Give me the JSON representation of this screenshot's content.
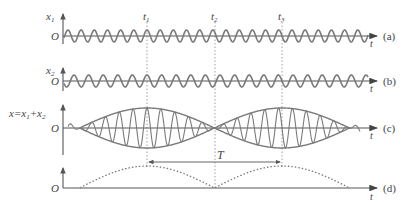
{
  "figure": {
    "colors": {
      "wave": "#7a7a7a",
      "axis": "#555555",
      "text": "#444444",
      "dotted": "#7a7a7a",
      "background": "#ffffff"
    },
    "panels": [
      {
        "id": "a",
        "tag": "(a)",
        "ylabel": "x",
        "ylabel_sub": "1",
        "origin": "O",
        "xlabel": "t"
      },
      {
        "id": "b",
        "tag": "(b)",
        "ylabel": "x",
        "ylabel_sub": "2",
        "origin": "O",
        "xlabel": "t"
      },
      {
        "id": "c",
        "tag": "(c)",
        "ylabel": "x=x",
        "ylabel_sub": "1",
        "ylabel_plus": "+x",
        "ylabel_sub2": "2",
        "origin": "O",
        "xlabel": "t"
      },
      {
        "id": "d",
        "tag": "(d)",
        "origin": "O",
        "xlabel": "t"
      }
    ],
    "time_markers": [
      {
        "label": "t",
        "sub": "1"
      },
      {
        "label": "t",
        "sub": "2"
      },
      {
        "label": "t",
        "sub": "3"
      }
    ],
    "period_label": "T"
  },
  "chart_data": {
    "type": "line",
    "panels": [
      {
        "name": "(a) x1",
        "description": "sinusoid, higher frequency, starts at peak",
        "relative_frequency": 1.075
      },
      {
        "name": "(b) x2",
        "description": "sinusoid, slightly lower frequency, starts at trough",
        "relative_frequency": 1.0
      },
      {
        "name": "(c) x = x1 + x2",
        "description": "amplitude-modulated sum with envelope; nodes at t2, maxima at t1 and t3"
      },
      {
        "name": "(d)",
        "description": "dotted envelope magnitude with humps peaking at t1 and t3, zero at t2"
      }
    ],
    "markers": [
      "t1",
      "t2",
      "t3"
    ],
    "period": "T = t3 - t1",
    "xlabel": "t"
  }
}
